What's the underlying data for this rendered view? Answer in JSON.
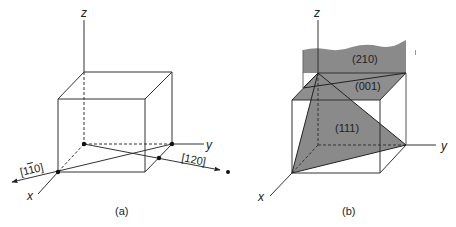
{
  "figure_a": {
    "caption": "(a)",
    "axes": {
      "x": "x",
      "y": "y",
      "z": "z"
    },
    "directions": [
      {
        "label": "[1ī0]",
        "display": "[1¯10]"
      },
      {
        "label": "[120]"
      }
    ],
    "label_1bar10": "[1",
    "label_1bar10_bar": "1",
    "label_1bar10_rest": "0]",
    "label_120": "[120]"
  },
  "figure_b": {
    "caption": "(b)",
    "axes": {
      "x": "x",
      "y": "y",
      "z": "z"
    },
    "planes": [
      {
        "label": "(210)"
      },
      {
        "label": "(001)"
      },
      {
        "label": "(111)"
      }
    ],
    "plane_color": "#8a8a8a"
  }
}
